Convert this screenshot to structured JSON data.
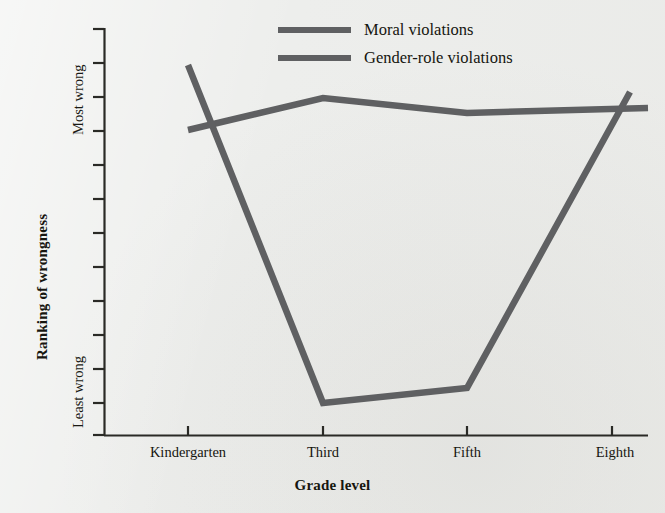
{
  "chart_data": {
    "type": "line",
    "title": "",
    "xlabel": "Grade level",
    "ylabel": "Ranking of wrongness",
    "categories": [
      "Kindergarten",
      "Third",
      "Fifth",
      "Eighth"
    ],
    "x_tick_labels": [
      "Kindergarten",
      "Third",
      "Fifth",
      "Eighth"
    ],
    "y_axis_endpoints": {
      "top": "Most wrong",
      "bottom": "Least wrong"
    },
    "y_tick_count": 13,
    "ylim": [
      0,
      100
    ],
    "grid": false,
    "legend_position": "top-center",
    "series": [
      {
        "name": "Moral violations",
        "color": "#5f6062",
        "values": [
          80,
          91,
          87,
          89
        ],
        "pixel_y": [
          130,
          98,
          113,
          108
        ]
      },
      {
        "name": "Gender-role violations",
        "color": "#5f6062",
        "values": [
          98,
          4,
          9,
          94
        ],
        "pixel_y": [
          65,
          403,
          388,
          92
        ]
      }
    ],
    "annotations": [
      "Moral violations stay consistently rated near 'Most wrong' across all grades.",
      "Gender-role violations drop sharply to 'Least wrong' by Third grade, then rise steeply again by Eighth grade."
    ]
  },
  "legend": {
    "items": [
      {
        "label": "Moral violations",
        "color": "#5f6062"
      },
      {
        "label": "Gender-role violations",
        "color": "#5f6062"
      }
    ]
  },
  "axes": {
    "y_title": "Ranking of wrongness",
    "y_top_label": "Most wrong",
    "y_bottom_label": "Least wrong",
    "x_title": "Grade level"
  },
  "colors": {
    "background": "#edeeec",
    "line": "#5f6062",
    "axis": "#2a2a26",
    "text": "#16160f"
  }
}
